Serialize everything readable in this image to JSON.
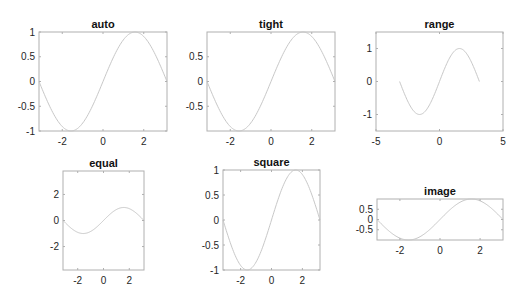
{
  "chart_data": [
    {
      "type": "line",
      "title": "auto",
      "x_function": "sin(x), x in [-pi, pi]",
      "xlim": [
        -3.1416,
        3.1416
      ],
      "ylim": [
        -1,
        1
      ],
      "xticks": [
        "-2",
        "0",
        "2"
      ],
      "xtick_values": [
        -2,
        0,
        2
      ],
      "yticks": [
        "-1",
        "-0.5",
        "0",
        "0.5",
        "1"
      ],
      "ytick_values": [
        -1,
        -0.5,
        0,
        0.5,
        1
      ],
      "box": [
        39,
        32,
        167,
        131
      ]
    },
    {
      "type": "line",
      "title": "tight",
      "x_function": "sin(x), x in [-pi, pi]",
      "xlim": [
        -3.1416,
        3.1416
      ],
      "ylim": [
        -1,
        1
      ],
      "xticks": [
        "-2",
        "0",
        "2"
      ],
      "xtick_values": [
        -2,
        0,
        2
      ],
      "yticks": [
        "-0.5",
        "0",
        "0.5"
      ],
      "ytick_values": [
        -0.5,
        0,
        0.5
      ],
      "box": [
        207,
        32,
        335,
        131
      ]
    },
    {
      "type": "line",
      "title": "range",
      "x_function": "sin(x), x in [-pi, pi]",
      "xlim": [
        -5,
        5
      ],
      "ylim": [
        -1.5,
        1.5
      ],
      "xticks": [
        "-5",
        "0",
        "5"
      ],
      "xtick_values": [
        -5,
        0,
        5
      ],
      "yticks": [
        "-1",
        "0",
        "1"
      ],
      "ytick_values": [
        -1,
        0,
        1
      ],
      "box": [
        376,
        32,
        503,
        131
      ]
    },
    {
      "type": "line",
      "title": "equal",
      "x_function": "sin(x), x in [-pi, pi]",
      "xlim": [
        -3.1416,
        3.1416
      ],
      "ylim": [
        -3.8,
        3.8
      ],
      "xticks": [
        "-2",
        "0",
        "2"
      ],
      "xtick_values": [
        -2,
        0,
        2
      ],
      "yticks": [
        "-2",
        "0",
        "2"
      ],
      "ytick_values": [
        -2,
        0,
        2
      ],
      "box": [
        63,
        171,
        144,
        270
      ]
    },
    {
      "type": "line",
      "title": "square",
      "x_function": "sin(x), x in [-pi, pi]",
      "xlim": [
        -3.1416,
        3.1416
      ],
      "ylim": [
        -1,
        1
      ],
      "xticks": [
        "-2",
        "0",
        "2"
      ],
      "xtick_values": [
        -2,
        0,
        2
      ],
      "yticks": [
        "-1",
        "-0.5",
        "0",
        "0.5",
        "1"
      ],
      "ytick_values": [
        -1,
        -0.5,
        0,
        0.5,
        1
      ],
      "box": [
        223,
        170,
        320,
        270
      ]
    },
    {
      "type": "line",
      "title": "image",
      "x_function": "sin(x), x in [-pi, pi]",
      "xlim": [
        -3.1416,
        3.1416
      ],
      "ylim": [
        -1,
        1
      ],
      "xticks": [
        "-2",
        "0",
        "2"
      ],
      "xtick_values": [
        -2,
        0,
        2
      ],
      "yticks": [
        "-0.5",
        "0",
        "0.5"
      ],
      "ytick_values": [
        -0.5,
        0,
        0.5
      ],
      "box": [
        377,
        199,
        503,
        240
      ]
    }
  ],
  "style": {
    "curve_color": "#c8c8c8",
    "axis_color": "#b0b0b0",
    "text_color": "#262626"
  }
}
